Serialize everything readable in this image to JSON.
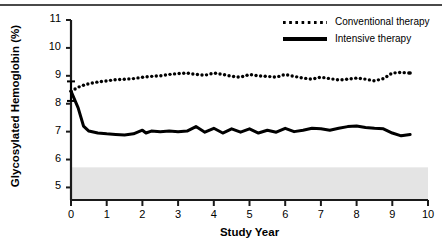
{
  "figure": {
    "top_rule": true,
    "background": "#ffffff"
  },
  "legend": {
    "position": "top-right",
    "entries": [
      {
        "label": "Conventional therapy",
        "style": "dotted",
        "color": "#000000"
      },
      {
        "label": "Intensive therapy",
        "style": "solid",
        "color": "#000000"
      }
    ]
  },
  "annotations": {
    "normal_band_label": "NORMAL—6.05"
  },
  "chart_data": {
    "type": "line",
    "title": "",
    "subtitle": "",
    "xlabel": "Study Year",
    "ylabel": "Glycosylated Hemoglobin (%)",
    "xlim": [
      0,
      10
    ],
    "ylim": [
      4.55,
      11
    ],
    "xticks": [
      0,
      1,
      2,
      3,
      4,
      5,
      6,
      7,
      8,
      9,
      10
    ],
    "xtick_labels": [
      "0",
      "1",
      "2",
      "3",
      "4",
      "5",
      "6",
      "7",
      "8",
      "9",
      "10"
    ],
    "yticks": [
      5,
      6,
      7,
      8,
      9,
      10,
      11
    ],
    "ytick_labels": [
      "5",
      "6",
      "7",
      "8",
      "9",
      "10",
      "11"
    ],
    "grid": false,
    "legend_position": "upper right",
    "shaded_regions": [
      {
        "name": "normal-range-band",
        "orientation": "horizontal",
        "y_from": 4.55,
        "y_to": 5.72,
        "color": "#e4e4e4",
        "label": "NORMAL—6.05"
      }
    ],
    "error_bars": [
      {
        "x": 0.0,
        "y": 8.45,
        "yerr": 0.35,
        "series": "Intensive therapy"
      }
    ],
    "series": [
      {
        "name": "Conventional therapy",
        "style": "dotted",
        "color": "#000000",
        "x": [
          0.0,
          0.25,
          0.5,
          0.75,
          1.0,
          1.25,
          1.5,
          1.75,
          2.0,
          2.25,
          2.5,
          2.75,
          3.0,
          3.25,
          3.5,
          3.75,
          4.0,
          4.25,
          4.5,
          4.75,
          5.0,
          5.25,
          5.5,
          5.75,
          6.0,
          6.25,
          6.5,
          6.75,
          7.0,
          7.25,
          7.5,
          7.75,
          8.0,
          8.25,
          8.5,
          8.75,
          9.0,
          9.25,
          9.5
        ],
        "y": [
          8.45,
          8.62,
          8.72,
          8.78,
          8.82,
          8.86,
          8.88,
          8.9,
          8.95,
          8.98,
          9.0,
          9.05,
          9.08,
          9.1,
          9.05,
          9.02,
          9.1,
          9.05,
          8.98,
          8.95,
          9.05,
          9.0,
          8.98,
          8.95,
          9.05,
          8.98,
          8.92,
          8.88,
          8.95,
          8.9,
          8.85,
          8.88,
          8.92,
          8.88,
          8.82,
          8.9,
          9.1,
          9.12,
          9.1
        ]
      },
      {
        "name": "Intensive therapy",
        "style": "solid",
        "color": "#000000",
        "x": [
          0.0,
          0.2,
          0.35,
          0.5,
          0.75,
          1.0,
          1.25,
          1.5,
          1.75,
          2.0,
          2.1,
          2.25,
          2.5,
          2.75,
          3.0,
          3.25,
          3.5,
          3.75,
          4.0,
          4.25,
          4.5,
          4.75,
          5.0,
          5.25,
          5.5,
          5.75,
          6.0,
          6.25,
          6.5,
          6.75,
          7.0,
          7.25,
          7.5,
          7.75,
          8.0,
          8.25,
          8.5,
          8.75,
          9.0,
          9.25,
          9.5
        ],
        "y": [
          8.45,
          7.85,
          7.2,
          7.02,
          6.95,
          6.92,
          6.9,
          6.88,
          6.92,
          7.05,
          6.95,
          7.02,
          7.0,
          7.02,
          7.0,
          7.02,
          7.18,
          6.98,
          7.12,
          6.95,
          7.1,
          6.98,
          7.1,
          6.95,
          7.05,
          6.98,
          7.12,
          7.0,
          7.05,
          7.12,
          7.1,
          7.05,
          7.12,
          7.18,
          7.2,
          7.15,
          7.12,
          7.1,
          6.95,
          6.85,
          6.9
        ]
      }
    ]
  }
}
